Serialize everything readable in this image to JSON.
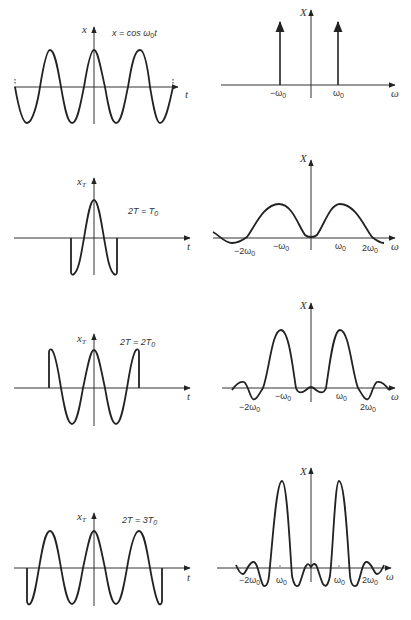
{
  "figure": {
    "panels": [
      {
        "id": "row1-time",
        "y_label": "x",
        "x_label": "t",
        "equation": "x = cos ω0t",
        "description": "Infinite cosine x = cos ω0 t"
      },
      {
        "id": "row1-freq",
        "y_label": "X",
        "x_label": "ω",
        "ticks": [
          "−ω0",
          "ω0"
        ],
        "description": "Two impulses at ±ω0"
      },
      {
        "id": "row2-time",
        "y_label": "xT",
        "x_label": "t",
        "annotation": "2T = T0",
        "description": "Cosine truncated to one period"
      },
      {
        "id": "row2-freq",
        "y_label": "X",
        "x_label": "ω",
        "ticks": [
          "−2ω0",
          "−ω0",
          "ω0",
          "2ω0"
        ],
        "description": "Broad two-lobe spectrum"
      },
      {
        "id": "row3-time",
        "y_label": "xT",
        "x_label": "t",
        "annotation": "2T = 2T0",
        "description": "Cosine truncated to two periods"
      },
      {
        "id": "row3-freq",
        "y_label": "X",
        "x_label": "ω",
        "ticks": [
          "−2ω0",
          "−ω0",
          "ω0",
          "2ω0"
        ],
        "description": "Narrower lobes at ±ω0"
      },
      {
        "id": "row4-time",
        "y_label": "xT",
        "x_label": "t",
        "annotation": "2T = 3T0",
        "description": "Cosine truncated to three periods"
      },
      {
        "id": "row4-freq",
        "y_label": "X",
        "x_label": "ω",
        "ticks": [
          "−2ω0",
          "ω0",
          "ω0",
          "2ω0"
        ],
        "description": "Sharp lobes at ±ω0 with sidelobes"
      }
    ]
  },
  "labels": {
    "r1l_y": "x",
    "r1l_t": "t",
    "r1l_eq_a": "x = cos ω",
    "r1l_eq_sub": "0",
    "r1l_eq_b": "t",
    "r1r_y": "X",
    "r1r_w": "ω",
    "r1r_neg": "−ω",
    "r1r_pos": "ω",
    "sub0": "0",
    "r2l_y": "x",
    "r2l_ysub": "T",
    "r2l_t": "t",
    "r2l_ann_a": "2T = T",
    "r2l_ann_sub": "0",
    "r2r_y": "X",
    "r2r_w": "ω",
    "r2r_m2": "−2ω",
    "r2r_m1": "−ω",
    "r2r_p1": "ω",
    "r2r_p2": "2ω",
    "r3l_y": "x",
    "r3l_ysub": "T",
    "r3l_t": "t",
    "r3l_ann_a": "2T = 2T",
    "r3l_ann_sub": "0",
    "r3r_y": "X",
    "r3r_w": "ω",
    "r3r_m2": "−2ω",
    "r3r_m1": "−ω",
    "r3r_p1": "ω",
    "r3r_p2": "2ω",
    "r4l_y": "x",
    "r4l_ysub": "T",
    "r4l_t": "t",
    "r4l_ann_a": "2T = 3T",
    "r4l_ann_sub": "0",
    "r4r_y": "X",
    "r4r_w": "ω",
    "r4r_m2": "−2ω",
    "r4r_m1": "ω",
    "r4r_p1": "ω",
    "r4r_p2": "2ω"
  }
}
